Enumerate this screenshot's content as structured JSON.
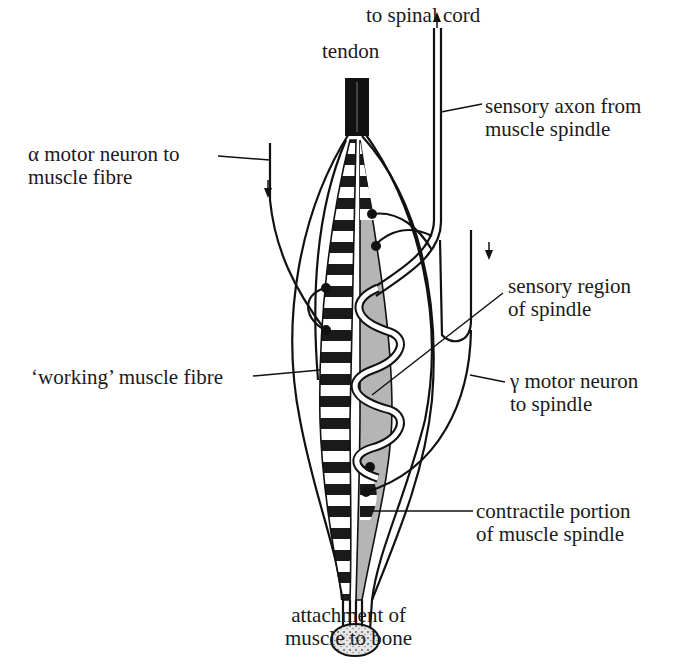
{
  "diagram": {
    "colors": {
      "ink": "#111111",
      "spindle_fill": "#b5b5b5",
      "background": "#ffffff",
      "bone_fill": "#d8d8d8"
    },
    "labels": {
      "to_spinal_cord": "to spinal cord",
      "tendon": "tendon",
      "sensory_axon": {
        "line1": "sensory axon from",
        "line2": "muscle spindle"
      },
      "alpha_motor": {
        "line1": "α motor neuron to",
        "line2": "muscle fibre"
      },
      "sensory_region": {
        "line1": "sensory region",
        "line2": "of spindle"
      },
      "working_fibre": "‘working’ muscle fibre",
      "gamma_motor": {
        "line1": "γ motor neuron",
        "line2": "to spindle"
      },
      "contractile_portion": {
        "line1": "contractile portion",
        "line2": "of muscle spindle"
      },
      "attachment": {
        "line1": "attachment of",
        "line2": "muscle to bone"
      }
    },
    "arrows": {
      "sensory_axon_direction": "up",
      "alpha_motor_direction": "down",
      "gamma_motor_direction": "down"
    }
  }
}
